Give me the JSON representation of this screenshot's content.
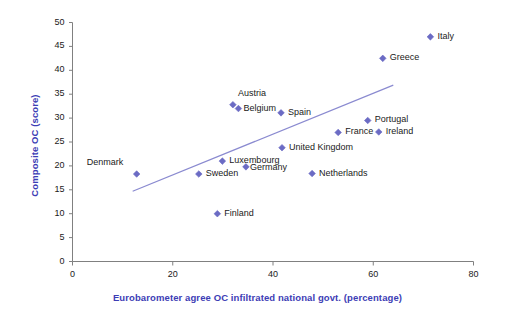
{
  "chart_data": {
    "type": "scatter",
    "title": "",
    "xlabel": "Eurobarometer agree OC infiltrated national govt. (percentage)",
    "ylabel": "Composite OC (score)",
    "xlim": [
      0,
      80
    ],
    "ylim": [
      0,
      50
    ],
    "xticks": [
      0,
      20,
      40,
      60,
      80
    ],
    "yticks": [
      0,
      5,
      10,
      15,
      20,
      25,
      30,
      35,
      40,
      45,
      50
    ],
    "grid": false,
    "legend": "none",
    "marker_color": "#6b6bc4",
    "trendline_color": "#8a8ad0",
    "axis_label_color": "#3d3db5",
    "points": [
      {
        "label": "Denmark",
        "x": 12.8,
        "y": 18.3,
        "label_dx": -50,
        "label_dy": -12
      },
      {
        "label": "Sweden",
        "x": 25.2,
        "y": 18.3,
        "label_dx": 7,
        "label_dy": -1
      },
      {
        "label": "Luxembourg",
        "x": 29.9,
        "y": 21.0,
        "label_dx": 7,
        "label_dy": -1
      },
      {
        "label": "Finland",
        "x": 28.9,
        "y": 10.0,
        "label_dx": 7,
        "label_dy": -1
      },
      {
        "label": "Austria",
        "x": 32.0,
        "y": 32.8,
        "label_dx": 5,
        "label_dy": -12
      },
      {
        "label": "Belgium",
        "x": 33.1,
        "y": 32.0,
        "label_dx": 5,
        "label_dy": -1
      },
      {
        "label": "Germany",
        "x": 34.6,
        "y": 19.8,
        "label_dx": 4,
        "label_dy": 0
      },
      {
        "label": "Spain",
        "x": 41.6,
        "y": 31.1,
        "label_dx": 7,
        "label_dy": -1
      },
      {
        "label": "United Kingdom",
        "x": 41.8,
        "y": 23.8,
        "label_dx": 7,
        "label_dy": -1
      },
      {
        "label": "Netherlands",
        "x": 47.8,
        "y": 18.4,
        "label_dx": 7,
        "label_dy": -1
      },
      {
        "label": "France",
        "x": 53.0,
        "y": 27.0,
        "label_dx": 7,
        "label_dy": -1
      },
      {
        "label": "Portugal",
        "x": 58.9,
        "y": 29.5,
        "label_dx": 7,
        "label_dy": -1
      },
      {
        "label": "Ireland",
        "x": 61.1,
        "y": 27.1,
        "label_dx": 7,
        "label_dy": -1
      },
      {
        "label": "Greece",
        "x": 61.9,
        "y": 42.5,
        "label_dx": 7,
        "label_dy": -1
      },
      {
        "label": "Italy",
        "x": 71.4,
        "y": 47.0,
        "label_dx": 7,
        "label_dy": -1
      }
    ],
    "trendline": {
      "x0": 12.0,
      "y0": 14.7,
      "x1": 64.0,
      "y1": 36.9
    }
  }
}
